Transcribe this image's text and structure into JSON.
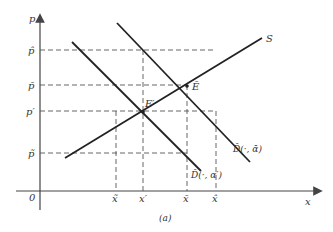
{
  "diagram": {
    "caption": "(a)",
    "axes": {
      "x_label": "x",
      "y_label": "p",
      "origin_label": "0"
    },
    "y_ticks": [
      {
        "label": "p̂",
        "y": 50
      },
      {
        "label": "p̄",
        "y": 85
      },
      {
        "label": "p′",
        "y": 111
      },
      {
        "label": "p̃",
        "y": 153
      }
    ],
    "x_ticks": [
      {
        "label": "x̃",
        "x": 116
      },
      {
        "label": "x′",
        "x": 143
      },
      {
        "label": "x̄",
        "x": 187
      },
      {
        "label": "x̂",
        "x": 216
      }
    ],
    "curves": {
      "supply": {
        "label": "S"
      },
      "demand_high": {
        "label": "D̂(·, ᾱ)"
      },
      "demand_low": {
        "label": "D̂(·, α′)"
      }
    },
    "points": {
      "E_bar": {
        "label": "Ē"
      },
      "E_prime": {
        "label": "E′"
      }
    }
  }
}
